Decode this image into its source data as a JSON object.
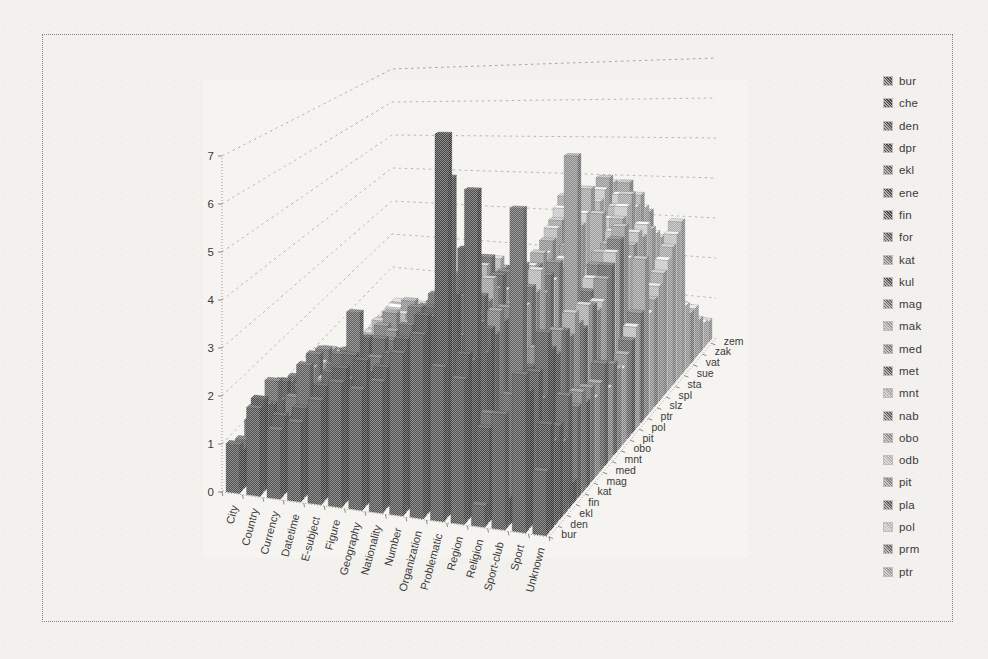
{
  "figure": {
    "background_color": "#f3f1ed",
    "border_color": "#85837c",
    "text_color": "#3a3a3a"
  },
  "chart_data": {
    "type": "bar",
    "projection": "3d-column",
    "title": "",
    "grid": true,
    "legend_position": "right",
    "value_axis": {
      "min": 0,
      "max": 7,
      "step": 1,
      "tick_labels": [
        "0",
        "1",
        "2",
        "3",
        "4",
        "5",
        "6",
        "7"
      ]
    },
    "categories": [
      "City",
      "Country",
      "Currency",
      "Datetime",
      "E-subject",
      "Figure",
      "Geography",
      "Nationality",
      "Number",
      "Organization",
      "Problematic",
      "Region",
      "Religion",
      "Sport-club",
      "Sport",
      "Unknown"
    ],
    "depth_axis_labels": [
      "bur",
      "den",
      "ekl",
      "fin",
      "kat",
      "mag",
      "med",
      "mnt",
      "obo",
      "pit",
      "pol",
      "ptr",
      "slz",
      "spl",
      "sta",
      "sue",
      "vat",
      "zak",
      "zem"
    ],
    "legend_entries": [
      "bur",
      "che",
      "den",
      "dpr",
      "ekl",
      "ene",
      "fin",
      "for",
      "kat",
      "kul",
      "mag",
      "mak",
      "med",
      "met",
      "mnt",
      "nab",
      "obo",
      "odb",
      "pit",
      "pla",
      "pol",
      "prm",
      "ptr"
    ],
    "series_colors": [
      "#4e4e4e",
      "#454545",
      "#575757",
      "#4b4b4b",
      "#5f5f5f",
      "#525252",
      "#494949",
      "#5b5b5b",
      "#787878",
      "#545454",
      "#6f6f6f",
      "#9b9b9b",
      "#7b7b7b",
      "#575757",
      "#a7a7a7",
      "#616161",
      "#8b8b8b",
      "#b3b3b3",
      "#818181",
      "#5d5d5d",
      "#b9b9b9",
      "#6b6b6b",
      "#999999",
      "#c1c1c1",
      "#8f8f8f",
      "#b5b5b5",
      "#9f9f9f",
      "#c7c7c7",
      "#a3a3a3",
      "#bdbdbd",
      "#ababab",
      "#c3c3c3",
      "#979797",
      "#bbbbbb",
      "#a5a5a5",
      "#cbcbcb",
      "#b1b1b1"
    ],
    "series": [
      {
        "name": "bur",
        "values": [
          1.0,
          1.8,
          1.4,
          1.6,
          2.1,
          2.5,
          2.4,
          2.6,
          3.2,
          3.6,
          3.0,
          2.8,
          0.4,
          2.2,
          3.0,
          1.2
        ]
      },
      {
        "name": "che",
        "values": [
          0.8,
          1.9,
          1.6,
          1.8,
          2.3,
          2.7,
          2.9,
          2.8,
          3.4,
          3.9,
          7.5,
          3.2,
          1.8,
          0.5,
          2.6,
          2.0
        ]
      },
      {
        "name": "den",
        "values": [
          0.9,
          1.7,
          1.5,
          2.6,
          2.2,
          2.4,
          2.6,
          2.5,
          3.6,
          3.8,
          6.6,
          3.0,
          2.0,
          2.4,
          0.6,
          1.6
        ]
      },
      {
        "name": "dpr",
        "values": [
          0.7,
          1.6,
          1.3,
          1.5,
          2.4,
          2.8,
          2.5,
          2.9,
          3.1,
          3.9,
          4.2,
          6.3,
          1.5,
          2.0,
          2.8,
          1.8
        ]
      },
      {
        "name": "ekl",
        "values": [
          1.1,
          2.0,
          1.7,
          1.9,
          2.0,
          3.6,
          2.7,
          2.4,
          3.8,
          4.1,
          3.3,
          3.6,
          0.3,
          5.9,
          2.2,
          1.4
        ]
      },
      {
        "name": "ene",
        "values": [
          0.6,
          1.5,
          1.2,
          1.4,
          2.6,
          2.3,
          3.0,
          2.7,
          3.0,
          3.7,
          4.0,
          2.9,
          1.2,
          1.8,
          3.4,
          2.2
        ]
      },
      {
        "name": "fin",
        "values": [
          0.9,
          1.8,
          1.6,
          1.7,
          2.2,
          2.9,
          2.6,
          3.1,
          3.5,
          4.0,
          4.9,
          3.3,
          1.6,
          2.6,
          3.0,
          0.4
        ]
      },
      {
        "name": "for",
        "values": [
          0.8,
          1.7,
          1.4,
          1.6,
          2.5,
          2.6,
          2.8,
          2.5,
          3.3,
          3.8,
          3.6,
          3.1,
          1.4,
          2.2,
          2.8,
          1.8
        ]
      },
      {
        "name": "kat",
        "values": [
          0.7,
          1.5,
          1.3,
          1.8,
          2.3,
          2.7,
          2.9,
          2.8,
          3.6,
          4.2,
          3.4,
          3.5,
          1.8,
          2.8,
          3.2,
          2.0
        ]
      },
      {
        "name": "kul",
        "values": [
          0.9,
          1.6,
          1.5,
          1.7,
          2.1,
          2.5,
          2.7,
          3.0,
          3.4,
          3.9,
          3.7,
          3.2,
          1.5,
          2.4,
          3.1,
          1.7
        ]
      },
      {
        "name": "mag",
        "values": [
          0.6,
          1.4,
          1.2,
          1.5,
          2.4,
          2.8,
          2.5,
          2.6,
          3.7,
          4.0,
          3.5,
          3.4,
          1.7,
          2.6,
          2.9,
          1.9
        ]
      },
      {
        "name": "mak",
        "values": [
          0.8,
          1.6,
          1.4,
          1.6,
          2.2,
          2.6,
          2.8,
          2.7,
          3.2,
          3.8,
          3.9,
          3.0,
          1.3,
          2.3,
          3.3,
          1.6
        ]
      },
      {
        "name": "med",
        "values": [
          0.7,
          1.5,
          1.3,
          1.7,
          2.3,
          2.9,
          2.6,
          2.9,
          3.5,
          4.1,
          3.6,
          3.3,
          1.6,
          2.5,
          3.0,
          1.8
        ]
      },
      {
        "name": "met",
        "values": [
          0.9,
          1.7,
          1.5,
          1.6,
          2.1,
          2.4,
          2.9,
          2.6,
          3.4,
          3.7,
          3.8,
          3.5,
          1.4,
          2.7,
          2.8,
          2.1
        ]
      },
      {
        "name": "mnt",
        "values": [
          0.6,
          1.4,
          1.1,
          1.5,
          2.5,
          2.7,
          2.4,
          2.8,
          3.1,
          3.9,
          3.4,
          3.1,
          1.7,
          2.4,
          3.2,
          1.5
        ]
      },
      {
        "name": "nab",
        "values": [
          0.8,
          1.6,
          1.4,
          1.8,
          2.2,
          2.5,
          2.8,
          2.5,
          3.6,
          4.0,
          3.7,
          3.4,
          1.2,
          2.6,
          3.1,
          1.9
        ]
      },
      {
        "name": "obo",
        "values": [
          0.7,
          1.5,
          1.2,
          1.6,
          2.4,
          2.8,
          2.5,
          2.7,
          3.3,
          3.6,
          3.5,
          3.2,
          1.5,
          6.2,
          2.9,
          1.7
        ]
      },
      {
        "name": "odb",
        "values": [
          0.5,
          1.3,
          1.1,
          1.4,
          2.1,
          2.6,
          2.7,
          2.9,
          3.0,
          3.8,
          3.3,
          3.6,
          1.8,
          2.5,
          3.0,
          1.6
        ]
      },
      {
        "name": "pit",
        "values": [
          0.6,
          1.2,
          1.0,
          1.3,
          2.0,
          2.4,
          2.6,
          2.5,
          3.2,
          3.5,
          3.6,
          3.0,
          1.4,
          2.8,
          3.4,
          1.8
        ]
      },
      {
        "name": "pla",
        "values": [
          0.4,
          1.1,
          0.9,
          1.2,
          1.9,
          2.3,
          2.4,
          2.6,
          2.9,
          3.4,
          3.2,
          3.3,
          1.6,
          3.0,
          3.6,
          2.0
        ]
      },
      {
        "name": "pol",
        "values": [
          0.5,
          1.0,
          0.8,
          1.1,
          1.8,
          2.2,
          2.5,
          2.4,
          3.0,
          3.3,
          3.4,
          3.1,
          1.9,
          3.2,
          3.8,
          2.2
        ]
      },
      {
        "name": "prm",
        "values": [
          0.3,
          0.9,
          0.7,
          1.0,
          1.7,
          2.1,
          2.3,
          2.5,
          2.8,
          3.2,
          3.3,
          3.4,
          2.1,
          3.4,
          4.0,
          2.4
        ]
      },
      {
        "name": "ptr",
        "values": [
          0.4,
          0.8,
          0.6,
          0.9,
          1.6,
          2.0,
          2.2,
          2.3,
          2.7,
          3.1,
          3.5,
          3.2,
          2.3,
          3.6,
          4.2,
          3.5
        ]
      },
      {
        "name": "",
        "values": [
          0.2,
          0.7,
          0.5,
          0.8,
          1.5,
          1.9,
          2.1,
          2.2,
          2.6,
          3.0,
          3.4,
          3.3,
          2.5,
          3.4,
          3.4,
          2.2
        ]
      },
      {
        "name": "slz",
        "values": [
          0.3,
          0.6,
          0.4,
          0.7,
          1.4,
          1.8,
          2.0,
          2.1,
          2.5,
          2.9,
          3.6,
          3.5,
          2.7,
          3.6,
          3.6,
          2.4
        ]
      },
      {
        "name": "",
        "values": [
          0.2,
          0.5,
          0.3,
          0.6,
          1.3,
          1.7,
          1.9,
          2.0,
          2.4,
          2.8,
          3.8,
          3.7,
          2.9,
          3.8,
          3.8,
          2.6
        ]
      },
      {
        "name": "spl",
        "values": [
          0.1,
          0.4,
          0.3,
          0.5,
          1.2,
          1.6,
          1.8,
          1.9,
          2.3,
          2.7,
          3.9,
          3.8,
          4.1,
          4.0,
          3.6,
          2.8
        ]
      },
      {
        "name": "",
        "values": [
          0.2,
          0.3,
          0.2,
          0.4,
          1.1,
          1.5,
          1.7,
          1.8,
          2.2,
          2.6,
          4.1,
          4.0,
          3.3,
          4.2,
          3.8,
          3.0
        ]
      },
      {
        "name": "sta",
        "values": [
          0.1,
          0.3,
          0.2,
          0.3,
          1.0,
          1.4,
          1.6,
          1.7,
          2.1,
          2.5,
          4.3,
          4.5,
          3.5,
          4.4,
          3.6,
          3.2
        ]
      },
      {
        "name": "",
        "values": [
          0.1,
          0.2,
          0.1,
          0.3,
          0.9,
          1.3,
          1.5,
          1.6,
          2.0,
          2.4,
          3.9,
          3.8,
          3.7,
          4.0,
          3.4,
          3.4
        ]
      },
      {
        "name": "sue",
        "values": [
          0.1,
          0.2,
          0.1,
          0.2,
          0.8,
          1.2,
          1.4,
          1.5,
          1.9,
          2.3,
          4.0,
          4.0,
          3.9,
          4.2,
          3.2,
          3.6
        ]
      },
      {
        "name": "",
        "values": [
          0.1,
          0.2,
          0.1,
          0.2,
          0.7,
          1.1,
          1.3,
          1.4,
          1.8,
          2.2,
          3.9,
          4.2,
          4.1,
          3.8,
          3.0,
          1.5
        ]
      },
      {
        "name": "vat",
        "values": [
          0.1,
          0.1,
          0.1,
          0.2,
          0.6,
          1.0,
          1.2,
          1.3,
          1.7,
          2.1,
          3.8,
          4.4,
          4.3,
          3.6,
          2.8,
          1.2
        ]
      },
      {
        "name": "",
        "values": [
          0.1,
          0.1,
          0.1,
          0.1,
          0.5,
          0.9,
          1.1,
          1.2,
          1.6,
          2.0,
          3.6,
          4.2,
          2.0,
          2.6,
          1.8,
          1.2
        ]
      },
      {
        "name": "zak",
        "values": [
          0.1,
          0.1,
          0.1,
          0.1,
          0.4,
          0.8,
          1.0,
          1.1,
          1.5,
          1.9,
          3.3,
          3.8,
          1.6,
          2.2,
          1.4,
          0.8
        ]
      },
      {
        "name": "",
        "values": [
          0.1,
          0.1,
          0.1,
          0.1,
          0.3,
          0.7,
          0.9,
          1.0,
          1.4,
          1.8,
          2.9,
          3.4,
          1.2,
          1.8,
          1.0,
          0.6
        ]
      },
      {
        "name": "zem",
        "values": [
          0.1,
          0.1,
          0.1,
          0.1,
          0.2,
          0.6,
          0.8,
          0.9,
          1.3,
          1.7,
          2.6,
          3.0,
          0.8,
          1.4,
          0.8,
          0.5
        ]
      }
    ]
  }
}
